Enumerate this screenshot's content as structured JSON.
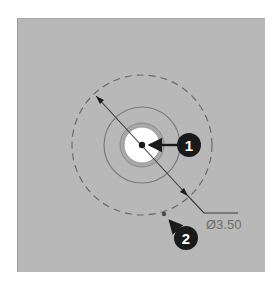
{
  "figure": {
    "background_color": "#b8b8b8",
    "dimension": {
      "label": "Ø3.50",
      "type": "diameter"
    },
    "callouts": [
      {
        "id": "callout-1",
        "label": "1",
        "target": "center point"
      },
      {
        "id": "callout-2",
        "label": "2",
        "target": "point on dashed circle"
      }
    ],
    "colors": {
      "callout_fill": "#1a1a1a",
      "callout_text": "#ffffff",
      "circle_stroke": "#7a7a7a",
      "dashed_circle_stroke": "#6a6a6a",
      "hole_fill": "#ffffff",
      "dimension_text": "#6e6e6e"
    }
  }
}
